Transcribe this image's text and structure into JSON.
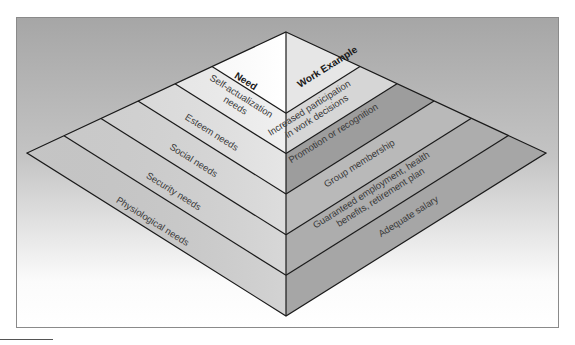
{
  "diagram": {
    "type": "pyramid",
    "headers": {
      "left": "Need",
      "right": "Work Example"
    },
    "levels": [
      {
        "need": "Self-actualization needs",
        "need_lines": [
          "Self-actualization",
          "needs"
        ],
        "work_example": "Increased participation in work decisions",
        "work_lines": [
          "Increased participation",
          "in work decisions"
        ],
        "left_color": "#eeeeee",
        "right_color": "#d6d6d6"
      },
      {
        "need": "Esteem needs",
        "need_lines": [
          "Esteem needs"
        ],
        "work_example": "Promotion or recognition",
        "work_lines": [
          "Promotion or recognition"
        ],
        "left_color": "#e2e2e2",
        "right_color": "#9d9d9d"
      },
      {
        "need": "Social needs",
        "need_lines": [
          "Social needs"
        ],
        "work_example": "Group membership",
        "work_lines": [
          "Group membership"
        ],
        "left_color": "#d8d8d8",
        "right_color": "#b9b9b9"
      },
      {
        "need": "Security needs",
        "need_lines": [
          "Security needs"
        ],
        "work_example": "Guaranteed employment, health benefits, retirement plan",
        "work_lines": [
          "Guaranteed employment, health",
          "benefits, retirement plan"
        ],
        "left_color": "#d2d2d2",
        "right_color": "#adadad"
      },
      {
        "need": "Physiological needs",
        "need_lines": [
          "Physiological needs"
        ],
        "work_example": "Adequate salary",
        "work_lines": [
          "Adequate salary"
        ],
        "left_color": "#cdcdcd",
        "right_color": "#a6a6a6"
      }
    ],
    "apex_left_color": "#ffffff",
    "apex_right_color": "#e6e6e6",
    "background_top": "#a6a6a6",
    "background_bottom": "#ffffff"
  }
}
